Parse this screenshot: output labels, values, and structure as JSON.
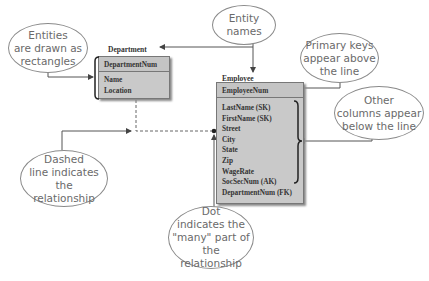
{
  "callouts": {
    "entities": "Entities\nare drawn as\nrectangles",
    "entity_names": "Entity\nnames",
    "primary_keys": "Primary keys\nappear above\nthe line",
    "other_columns": "Other\ncolumns appear\nbelow the line",
    "dashed_line": "Dashed\nline indicates the\nrelationship",
    "dot": "Dot\nindicates the\n\"many\" part of the\nrelationship"
  },
  "entities": {
    "department": {
      "name": "Department",
      "primary_key": "DepartmentNum",
      "columns": [
        "Name",
        "Location"
      ]
    },
    "employee": {
      "name": "Employee",
      "primary_key": "EmployeeNum",
      "columns": [
        "LastName (SK)",
        "FirstName (SK)",
        "Street",
        "City",
        "State",
        "Zip",
        "WageRate",
        "SocSecNum (AK)",
        "DepartmentNum (FK)"
      ]
    }
  },
  "colors": {
    "entity_fill": "#c9c9c9",
    "callout_border": "#8a8a8a",
    "line": "#555555"
  }
}
